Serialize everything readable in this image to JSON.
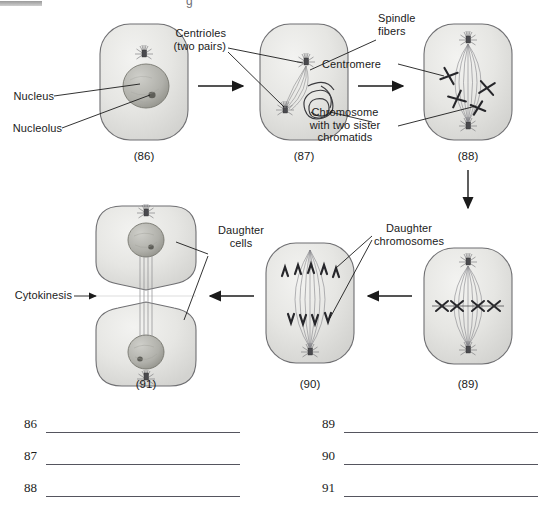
{
  "page": {
    "top_fragment_glyph": "g"
  },
  "labels": {
    "nucleus": "Nucleus",
    "nucleolus": "Nucleolus",
    "centrioles": "Centrioles\n(two pairs)",
    "spindle_fibers": "Spindle\nfibers",
    "centromere": "Centromere",
    "chromosome_sisters": "Chromosome\nwith two sister\nchromatids",
    "daughter_cells": "Daughter\ncells",
    "daughter_chromosomes": "Daughter\nchromosomes",
    "cytokinesis": "Cytokinesis"
  },
  "figures": [
    {
      "id": "86",
      "caption": "(86)"
    },
    {
      "id": "87",
      "caption": "(87)"
    },
    {
      "id": "88",
      "caption": "(88)"
    },
    {
      "id": "89",
      "caption": "(89)"
    },
    {
      "id": "90",
      "caption": "(90)"
    },
    {
      "id": "91",
      "caption": "(91)"
    }
  ],
  "answer_lines": {
    "left": [
      {
        "number": "86",
        "value": ""
      },
      {
        "number": "87",
        "value": ""
      },
      {
        "number": "88",
        "value": ""
      }
    ],
    "right": [
      {
        "number": "89",
        "value": ""
      },
      {
        "number": "90",
        "value": ""
      },
      {
        "number": "91",
        "value": ""
      }
    ]
  },
  "colors": {
    "ink": "#1b1b1b",
    "line": "#55555e",
    "cell_fill": "#e8e8e6",
    "cell_stroke": "#6f6f72",
    "nucleus_fill": "#b9b9b5",
    "chromosome": "#2a2a2e"
  }
}
